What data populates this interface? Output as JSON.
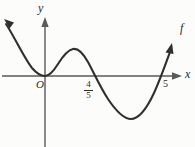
{
  "figure": {
    "name": "polynomial-graph",
    "background_color": "#fcfcfa",
    "curve_color": "#2f2f2f",
    "axis_color": "#5a5a5a"
  },
  "axes": {
    "y_axis_label": "y",
    "x_axis_label": "x",
    "origin_label": "O",
    "x_axis_y_px": 76,
    "y_axis_x_px": 45,
    "x_axis_start_px": 2,
    "x_axis_end_px": 178,
    "y_axis_top_px": 18,
    "y_axis_bottom_px": 147
  },
  "curve": {
    "function_label": "f",
    "stroke_width": 2.1,
    "path": "M 6,24 C 14,36 24,58 32,68 C 38,75 42,76 45,76 C 49,76 53,72 58,64 C 63,56 68,50 73,49 C 78,48 83,53 88,62 C 94,73 100,87 108,99 C 116,111 124,119 131,119 C 139,119 147,108 154,93 C 160,80 166,63 170,52",
    "left_arrow": {
      "tip_x": 4,
      "tip_y": 20,
      "angle_deg": -54
    },
    "right_arrow": {
      "tip_x": 171,
      "tip_y": 45,
      "angle_deg": -68
    }
  },
  "ticks": [
    {
      "name": "x-intercept-four-fifths",
      "label_numerator": "4",
      "label_denominator": "5",
      "x_px": 93,
      "is_fraction": true
    },
    {
      "name": "x-intercept-five",
      "label": "5",
      "x_px": 160,
      "is_fraction": false
    }
  ],
  "roots": {
    "description_values": [
      "0",
      "4/5",
      "5"
    ]
  }
}
